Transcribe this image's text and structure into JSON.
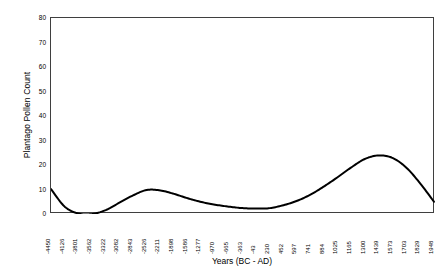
{
  "chart_data": {
    "type": "line",
    "title": "",
    "xlabel": "Years (BC - AD)",
    "ylabel": "Plantago Pollen Count",
    "ylim": [
      0,
      80
    ],
    "y_ticks": [
      80,
      70,
      60,
      50,
      40,
      30,
      20,
      10,
      0
    ],
    "grid": false,
    "legend": "none",
    "line_color": "#000000",
    "categories": [
      "-4450",
      "-4126",
      "-3801",
      "-3562",
      "-3322",
      "-3082",
      "-2843",
      "-2526",
      "-2211",
      "-1898",
      "-1586",
      "-1277",
      "-970",
      "-665",
      "-363",
      "-43",
      "230",
      "452",
      "597",
      "741",
      "884",
      "1025",
      "1165",
      "1300",
      "1439",
      "1573",
      "1703",
      "1829",
      "1948"
    ],
    "series": [
      {
        "name": "Plantago Pollen Count",
        "values": [
          10.2,
          3.0,
          0.2,
          0.0,
          1.6,
          4.6,
          7.6,
          9.8,
          9.6,
          8.2,
          6.4,
          4.9,
          3.8,
          3.0,
          2.4,
          2.2,
          2.4,
          3.6,
          5.4,
          8.0,
          11.4,
          15.2,
          19.2,
          22.6,
          23.9,
          22.8,
          18.8,
          12.4,
          5.0
        ]
      }
    ]
  },
  "axes": {
    "y_title": "Plantago Pollen Count",
    "x_title": "Years (BC - AD)"
  }
}
